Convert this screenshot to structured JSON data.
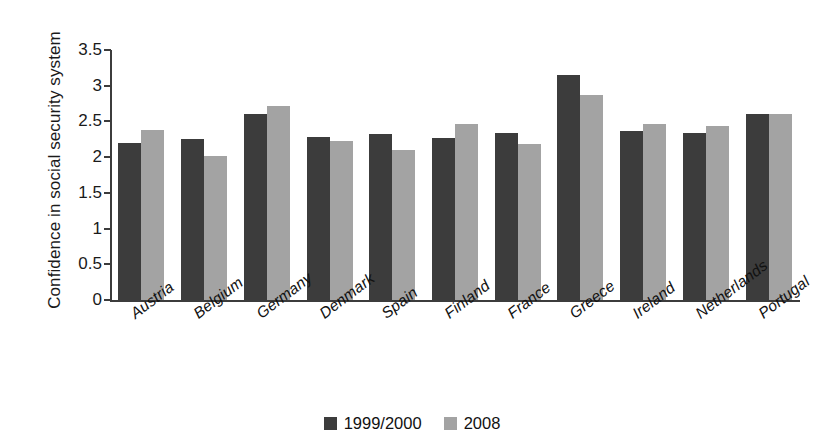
{
  "chart_data": {
    "type": "bar",
    "title": "",
    "subtitle": "",
    "xlabel": "",
    "ylabel": "Confidence in social security system",
    "ylim": [
      0,
      3.5
    ],
    "ytick_step": 0.5,
    "ytick_labels": [
      "0",
      "0.5",
      "1",
      "1.5",
      "2",
      "2.5",
      "3",
      "3.5"
    ],
    "grid": false,
    "legend_position": "bottom-center",
    "categories": [
      "Austria",
      "Belgium",
      "Germany",
      "Denmark",
      "Spain",
      "Finland",
      "France",
      "Greece",
      "Ireland",
      "Netherlands",
      "Portugal"
    ],
    "series": [
      {
        "name": "1999/2000",
        "color": "#3c3c3c",
        "values": [
          2.2,
          2.25,
          2.6,
          2.28,
          2.33,
          2.27,
          2.34,
          3.15,
          2.37,
          2.34,
          2.6
        ]
      },
      {
        "name": "2008",
        "color": "#a3a3a3",
        "values": [
          2.38,
          2.01,
          2.72,
          2.23,
          2.1,
          2.47,
          2.19,
          2.87,
          2.46,
          2.43,
          2.61
        ]
      }
    ]
  },
  "axis": {
    "y_title": "Confidence in social security system"
  },
  "legend": {
    "items": [
      {
        "label": "1999/2000",
        "color": "#3c3c3c"
      },
      {
        "label": "2008",
        "color": "#a3a3a3"
      }
    ]
  },
  "colors": {
    "series_1999_2000": "#3c3c3c",
    "series_2008": "#a3a3a3",
    "axis": "#3c3c3c",
    "text": "#111111",
    "background": "#ffffff"
  }
}
